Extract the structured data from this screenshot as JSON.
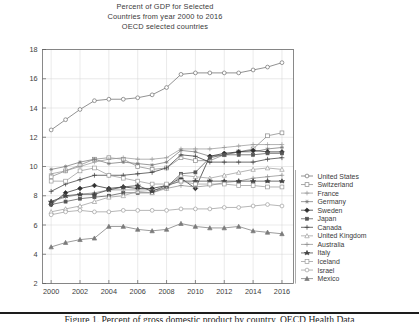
{
  "figure": {
    "title_lines": [
      "Percent of GDP for Selected",
      "Countries from year 2000 to 2016",
      "OECD selected countries"
    ],
    "caption": "Figure 1. Percent of gross domestic product by country, OECD Health Data"
  },
  "axes": {
    "y_ticks": [
      "18",
      "16",
      "14",
      "12",
      "10",
      "8",
      "6",
      "4",
      "2"
    ],
    "x_ticks": [
      "2000",
      "2002",
      "2004",
      "2006",
      "2008",
      "2010",
      "2012",
      "2014",
      "2016"
    ],
    "xlabel": "",
    "ylabel": ""
  },
  "chart_data": {
    "type": "line",
    "xlabel": "",
    "ylabel": "",
    "xlim": [
      1999.4,
      2016.8
    ],
    "ylim": [
      2,
      18
    ],
    "grid": true,
    "legend_position": "right",
    "x": [
      2000,
      2001,
      2002,
      2003,
      2004,
      2005,
      2006,
      2007,
      2008,
      2009,
      2010,
      2011,
      2012,
      2013,
      2014,
      2015,
      2016
    ],
    "series": [
      {
        "name": "United States",
        "marker": "circle-open",
        "color": "#6e6e6e",
        "values": [
          12.5,
          13.2,
          13.9,
          14.5,
          14.6,
          14.6,
          14.7,
          14.9,
          15.4,
          16.3,
          16.4,
          16.4,
          16.4,
          16.4,
          16.6,
          16.8,
          17.1
        ]
      },
      {
        "name": "Switzerland",
        "marker": "square-open",
        "color": "#8a8a8a",
        "values": [
          9.3,
          9.7,
          10.1,
          10.5,
          10.6,
          10.5,
          10.0,
          9.8,
          9.9,
          10.6,
          10.4,
          10.4,
          10.8,
          11.0,
          11.2,
          12.1,
          12.3
        ]
      },
      {
        "name": "France",
        "marker": "plus",
        "color": "#9a9a9a",
        "values": [
          9.5,
          9.7,
          10.0,
          10.3,
          10.5,
          10.6,
          10.5,
          10.5,
          10.6,
          11.2,
          11.2,
          11.2,
          11.3,
          11.4,
          11.5,
          11.5,
          11.5
        ]
      },
      {
        "name": "Germany",
        "marker": "asterisk",
        "color": "#787878",
        "values": [
          9.8,
          10.0,
          10.3,
          10.5,
          10.2,
          10.3,
          10.2,
          10.1,
          10.3,
          11.1,
          11.0,
          10.7,
          10.8,
          11.0,
          11.0,
          11.2,
          11.3
        ]
      },
      {
        "name": "Sweden",
        "marker": "diamond-filled",
        "color": "#2f2f2f",
        "values": [
          7.4,
          8.2,
          8.5,
          8.7,
          8.5,
          8.6,
          8.5,
          8.5,
          8.7,
          9.2,
          8.5,
          10.7,
          10.9,
          11.0,
          11.1,
          11.0,
          11.0
        ]
      },
      {
        "name": "Japan",
        "marker": "square-filled-sm",
        "color": "#555555",
        "values": [
          7.4,
          7.6,
          7.8,
          7.9,
          8.0,
          8.2,
          8.2,
          8.2,
          8.6,
          9.5,
          9.6,
          10.6,
          10.8,
          10.8,
          10.8,
          10.9,
          10.9
        ]
      },
      {
        "name": "Canada",
        "marker": "plus-filled",
        "color": "#3c3c3c",
        "values": [
          8.3,
          8.8,
          9.1,
          9.4,
          9.4,
          9.4,
          9.5,
          9.6,
          9.9,
          10.8,
          10.7,
          10.3,
          10.3,
          10.3,
          10.3,
          10.5,
          10.6
        ]
      },
      {
        "name": "United Kingdom",
        "marker": "triangle-open",
        "color": "#9d9d9d",
        "values": [
          6.9,
          7.1,
          7.3,
          7.6,
          7.9,
          8.0,
          8.3,
          8.2,
          8.5,
          9.4,
          9.3,
          9.2,
          9.4,
          9.6,
          9.8,
          9.9,
          9.8
        ]
      },
      {
        "name": "Australia",
        "marker": "plus-2",
        "color": "#8e8e8e",
        "values": [
          7.6,
          7.9,
          8.1,
          8.2,
          8.4,
          8.4,
          8.4,
          8.4,
          8.5,
          8.7,
          8.6,
          8.7,
          8.9,
          9.0,
          9.2,
          9.3,
          9.4
        ]
      },
      {
        "name": "Italy",
        "marker": "star-filled",
        "color": "#444444",
        "values": [
          7.6,
          8.0,
          8.1,
          8.1,
          8.4,
          8.6,
          8.7,
          8.3,
          8.7,
          9.0,
          9.0,
          9.0,
          9.0,
          9.0,
          9.0,
          9.0,
          9.0
        ]
      },
      {
        "name": "Iceland",
        "marker": "square-open-2",
        "color": "#9b9b9b",
        "values": [
          9.0,
          9.0,
          9.7,
          9.9,
          9.4,
          9.2,
          9.0,
          8.8,
          8.8,
          9.0,
          8.8,
          8.8,
          8.8,
          8.7,
          8.7,
          8.6,
          8.6
        ]
      },
      {
        "name": "Israel",
        "marker": "circle-open-2",
        "color": "#9e9e9e",
        "values": [
          6.7,
          6.9,
          7.0,
          6.9,
          6.9,
          7.0,
          7.0,
          7.0,
          7.0,
          7.1,
          7.1,
          7.1,
          7.2,
          7.2,
          7.3,
          7.4,
          7.3
        ]
      },
      {
        "name": "Mexico",
        "marker": "triangle-filled",
        "color": "#7b7b7b",
        "values": [
          4.5,
          4.8,
          5.0,
          5.1,
          5.9,
          5.9,
          5.7,
          5.6,
          5.7,
          6.1,
          5.9,
          5.8,
          5.8,
          5.9,
          5.6,
          5.5,
          5.4
        ]
      }
    ]
  },
  "legend": {
    "entries": [
      {
        "label": "United States"
      },
      {
        "label": "Switzerland"
      },
      {
        "label": "France"
      },
      {
        "label": "Germany"
      },
      {
        "label": "Sweden"
      },
      {
        "label": "Japan"
      },
      {
        "label": "Canada"
      },
      {
        "label": "United Kingdom"
      },
      {
        "label": "Australia"
      },
      {
        "label": "Italy"
      },
      {
        "label": "Iceland"
      },
      {
        "label": "Israel"
      },
      {
        "label": "Mexico"
      }
    ]
  }
}
